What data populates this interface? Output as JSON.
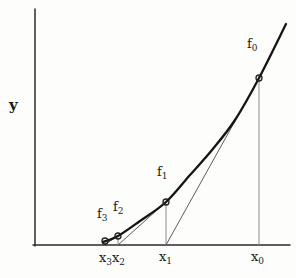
{
  "figure": {
    "type": "math-diagram"
  },
  "labels": {
    "y_axis": {
      "text": "y",
      "x": 9,
      "y": 98
    },
    "f0": {
      "base": "f",
      "sub": "0",
      "x": 247,
      "y": 37
    },
    "f1": {
      "base": "f",
      "sub": "1",
      "x": 157,
      "y": 165
    },
    "f2": {
      "base": "f",
      "sub": "2",
      "x": 113,
      "y": 200
    },
    "f3": {
      "base": "f",
      "sub": "3",
      "x": 97,
      "y": 207
    },
    "x3": {
      "base": "x",
      "sub": "3",
      "x": 99,
      "y": 251
    },
    "x2": {
      "base": "x",
      "sub": "2",
      "x": 112,
      "y": 251
    },
    "x1": {
      "base": "x",
      "sub": "1",
      "x": 159,
      "y": 250
    },
    "x0": {
      "base": "x",
      "sub": "0",
      "x": 251,
      "y": 250
    }
  },
  "diagram_data": {
    "canvas": {
      "width": 296,
      "height": 278
    },
    "axes": {
      "y_axis": {
        "x1": 35,
        "y1": 9,
        "x2": 35,
        "y2": 246
      },
      "x_axis": {
        "x1": 33,
        "y1": 245,
        "x2": 290,
        "y2": 245
      }
    },
    "curve": {
      "name": "f(x)",
      "points": [
        [
          103,
          242
        ],
        [
          118,
          236
        ],
        [
          140,
          221
        ],
        [
          166,
          202
        ],
        [
          190,
          175
        ],
        [
          212,
          150
        ],
        [
          235,
          120
        ],
        [
          259,
          78
        ],
        [
          286,
          24
        ]
      ]
    },
    "markers": [
      {
        "name": "point-x3-f3",
        "x": 105,
        "y": 241
      },
      {
        "name": "point-x2-f2",
        "x": 118,
        "y": 236
      },
      {
        "name": "point-x1-f1",
        "x": 166,
        "y": 202
      },
      {
        "name": "point-x0-f0",
        "x": 259,
        "y": 78
      }
    ],
    "marker_radius": 3,
    "ordinates": [
      {
        "name": "ordinate-x0",
        "from": [
          259,
          245
        ],
        "to": [
          259,
          80
        ]
      },
      {
        "name": "ordinate-x1",
        "from": [
          166,
          245
        ],
        "to": [
          166,
          204
        ]
      },
      {
        "name": "ordinate-x2",
        "from": [
          118,
          245
        ],
        "to": [
          118,
          238
        ]
      }
    ],
    "tangents": [
      {
        "name": "tangent-f0-to-x1",
        "from": [
          259,
          78
        ],
        "to": [
          166,
          245
        ]
      },
      {
        "name": "tangent-f1-to-x2",
        "from": [
          166,
          202
        ],
        "to": [
          118,
          245
        ]
      },
      {
        "name": "tangent-f2-to-x3",
        "from": [
          118,
          236
        ],
        "to": [
          104,
          245
        ]
      }
    ],
    "colors": {
      "curve": "#151515",
      "axis": "#2b2b2b",
      "ordinate": "#8a8a8a",
      "tangent": "#4a4a4a",
      "marker_stroke": "#222222",
      "background": "#fdfdfc",
      "label": "#1a1a1a"
    }
  }
}
